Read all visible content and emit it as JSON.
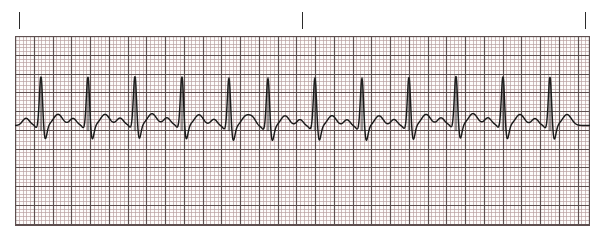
{
  "document": {
    "kind": "ecg-rhythm-strip",
    "title": "ECG Rhythm Strip",
    "paper_color": "#fdfcfb",
    "grid_minor_color": "#b9a0a0",
    "grid_major_color": "#5e4f4f",
    "trace_color": "#1a1a1a",
    "tick_color": "#2b2b2b"
  },
  "tick_marks": {
    "name": "timing-interval-marks",
    "count": 3,
    "positions_px": [
      19,
      302,
      585
    ],
    "top_px": 12,
    "height_px": 17
  },
  "grid": {
    "left_px": 15,
    "top_px": 36,
    "width_px": 575,
    "height_px": 190,
    "minor_square_px": 3.75,
    "major_every": 5,
    "major_square_px": 18.75,
    "paper_speed_mm_per_s": 25,
    "gain_mm_per_mV": 10
  },
  "chart_data": {
    "type": "line",
    "xlabel": "Time",
    "ylabel": "Amplitude",
    "grid": true,
    "legend": "none",
    "baseline_y_px": 126,
    "beat_count": 12,
    "r_peak_x_px": [
      41,
      88,
      135,
      182,
      229,
      268,
      315,
      362,
      409,
      456,
      503,
      550
    ],
    "beat_interval_px": 47,
    "morphology": {
      "p_wave": {
        "amplitude_px": 7,
        "width_px": 11,
        "offset_before_r_px": -15
      },
      "q_dip": {
        "amplitude_px": -3,
        "offset_px": -4
      },
      "r_spike": {
        "amplitude_px": 50,
        "half_width_px": 1.6
      },
      "s_trough": {
        "amplitude_px": -15,
        "offset_px": 4,
        "width_px": 4
      },
      "t_wave": {
        "amplitude_px": 11,
        "width_px": 13,
        "offset_after_r_px": 17
      }
    },
    "axis_note": "Scanned ECG graph paper: 1 small box = 0.04 s x 0.1 mV; 1 large box = 0.20 s x 0.5 mV"
  }
}
